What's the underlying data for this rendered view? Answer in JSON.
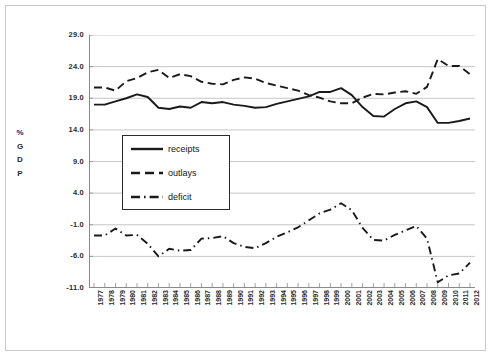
{
  "chart_data": {
    "type": "line",
    "title": "",
    "xlabel": "",
    "ylabel": "% GDP",
    "ylabel_letters": [
      "%",
      "G",
      "D",
      "P"
    ],
    "ylim": [
      -11.0,
      29.0
    ],
    "ytick_step": 5.0,
    "yticks": [
      "29.0",
      "24.0",
      "19.0",
      "14.0",
      "9.0",
      "4.0",
      "-1.0",
      "-6.0",
      "-11.0"
    ],
    "ytick_values": [
      29.0,
      24.0,
      19.0,
      14.0,
      9.0,
      4.0,
      -1.0,
      -6.0,
      -11.0
    ],
    "grid": "horizontal",
    "legend_position": "inside-left",
    "categories": [
      "1977",
      "1978",
      "1979",
      "1980",
      "1981",
      "1982",
      "1983",
      "1984",
      "1985",
      "1986",
      "1987",
      "1988",
      "1989",
      "1990",
      "1991",
      "1992",
      "1993",
      "1994",
      "1995",
      "1996",
      "1997",
      "1998",
      "1999",
      "2000",
      "2001",
      "2002",
      "2003",
      "2004",
      "2005",
      "2006",
      "2007",
      "2008",
      "2009",
      "2010",
      "2011",
      "2012"
    ],
    "x": [
      1977,
      1978,
      1979,
      1980,
      1981,
      1982,
      1983,
      1984,
      1985,
      1986,
      1987,
      1988,
      1989,
      1990,
      1991,
      1992,
      1993,
      1994,
      1995,
      1996,
      1997,
      1998,
      1999,
      2000,
      2001,
      2002,
      2003,
      2004,
      2005,
      2006,
      2007,
      2008,
      2009,
      2010,
      2011,
      2012
    ],
    "series": [
      {
        "name": "receipts",
        "style": "solid",
        "color": "#1a1a1a",
        "values": [
          18.0,
          18.0,
          18.5,
          19.0,
          19.6,
          19.2,
          17.5,
          17.3,
          17.7,
          17.5,
          18.4,
          18.2,
          18.4,
          18.0,
          17.8,
          17.5,
          17.6,
          18.1,
          18.5,
          18.9,
          19.3,
          20.0,
          20.0,
          20.6,
          19.5,
          17.6,
          16.2,
          16.1,
          17.3,
          18.2,
          18.5,
          17.6,
          15.1,
          15.1,
          15.4,
          15.8
        ]
      },
      {
        "name": "outlays",
        "style": "dashed",
        "color": "#1a1a1a",
        "values": [
          20.7,
          20.7,
          20.2,
          21.7,
          22.2,
          23.1,
          23.5,
          22.2,
          22.8,
          22.5,
          21.6,
          21.3,
          21.2,
          21.9,
          22.3,
          22.1,
          21.4,
          21.0,
          20.6,
          20.2,
          19.5,
          19.1,
          18.5,
          18.2,
          18.2,
          19.1,
          19.7,
          19.6,
          19.9,
          20.1,
          19.7,
          20.8,
          25.2,
          24.1,
          24.1,
          22.8
        ]
      },
      {
        "name": "deficit",
        "style": "dashdot",
        "color": "#1a1a1a",
        "values": [
          -2.7,
          -2.7,
          -1.6,
          -2.7,
          -2.6,
          -4.0,
          -6.0,
          -4.8,
          -5.1,
          -5.0,
          -3.2,
          -3.1,
          -2.8,
          -3.9,
          -4.5,
          -4.7,
          -3.9,
          -2.9,
          -2.2,
          -1.4,
          -0.3,
          0.8,
          1.4,
          2.4,
          1.3,
          -1.5,
          -3.4,
          -3.5,
          -2.6,
          -1.9,
          -1.2,
          -3.2,
          -10.1,
          -9.0,
          -8.7,
          -7.0
        ]
      }
    ],
    "legend": [
      {
        "label": "receipts",
        "style": "solid"
      },
      {
        "label": "outlays",
        "style": "dashed"
      },
      {
        "label": "deficit",
        "style": "dashdot"
      }
    ]
  }
}
